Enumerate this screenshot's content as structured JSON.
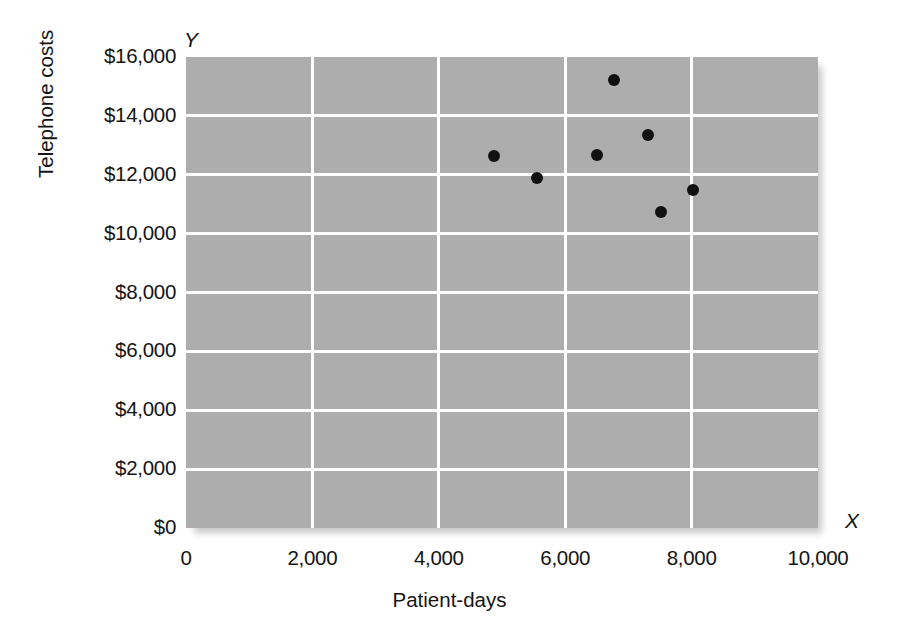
{
  "chart_data": {
    "type": "scatter",
    "title": "",
    "xlabel": "Patient-days",
    "ylabel": "Telephone costs",
    "x_axis_letter": "X",
    "y_axis_letter": "Y",
    "xlim": [
      0,
      10000
    ],
    "ylim": [
      0,
      16000
    ],
    "grid": true,
    "legend": "none",
    "plot_background": "#adadad",
    "gridline_color": "#ffffff",
    "point_color": "#111111",
    "x_ticks": [
      {
        "value": 0,
        "label": "0"
      },
      {
        "value": 2000,
        "label": "2,000"
      },
      {
        "value": 4000,
        "label": "4,000"
      },
      {
        "value": 6000,
        "label": "6,000"
      },
      {
        "value": 8000,
        "label": "8,000"
      },
      {
        "value": 10000,
        "label": "10,000"
      }
    ],
    "y_ticks": [
      {
        "value": 0,
        "label": "$0"
      },
      {
        "value": 2000,
        "label": "$2,000"
      },
      {
        "value": 4000,
        "label": "$4,000"
      },
      {
        "value": 6000,
        "label": "$6,000"
      },
      {
        "value": 8000,
        "label": "$8,000"
      },
      {
        "value": 10000,
        "label": "$10,000"
      },
      {
        "value": 12000,
        "label": "$12,000"
      },
      {
        "value": 14000,
        "label": "$14,000"
      },
      {
        "value": 16000,
        "label": "$16,000"
      }
    ],
    "points": [
      {
        "x": 4870,
        "y": 12640
      },
      {
        "x": 5550,
        "y": 11890
      },
      {
        "x": 6500,
        "y": 12670
      },
      {
        "x": 6770,
        "y": 15220
      },
      {
        "x": 7310,
        "y": 13350
      },
      {
        "x": 7520,
        "y": 10730
      },
      {
        "x": 8020,
        "y": 11480
      }
    ]
  }
}
